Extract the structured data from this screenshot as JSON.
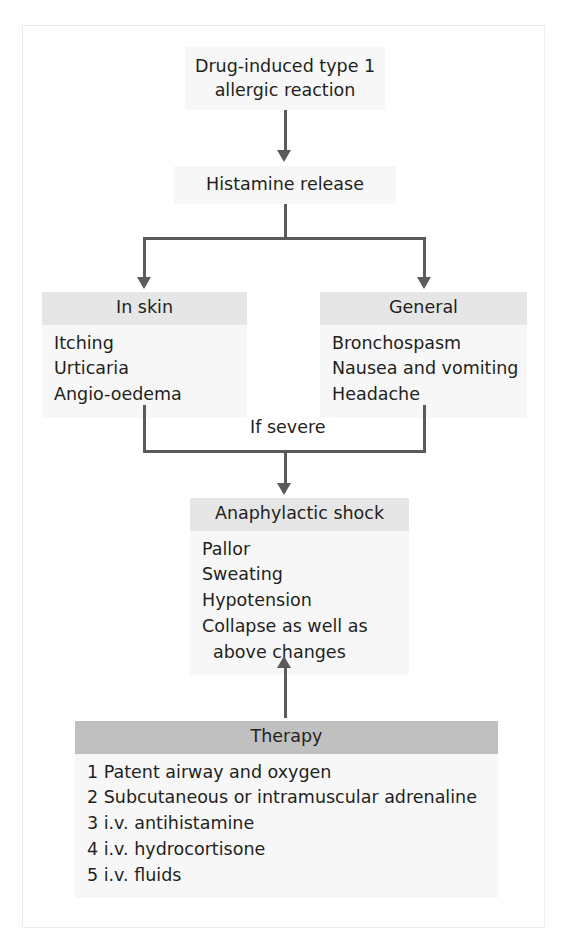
{
  "diagram": {
    "colors": {
      "header_band": "#e6e6e6",
      "therapy_header_band": "#c0c0c0",
      "box_fill": "#f7f7f7",
      "connector": "#5a5a5a",
      "text": "#231f20",
      "frame": "#ececec"
    },
    "nodes": {
      "cause": {
        "line1": "Drug-induced type 1",
        "line2": "allergic reaction"
      },
      "mediator": {
        "label": "Histamine release"
      },
      "skin": {
        "header": "In skin",
        "items": [
          "Itching",
          "Urticaria",
          "Angio-oedema"
        ]
      },
      "general": {
        "header": "General",
        "items": [
          "Bronchospasm",
          "Nausea and vomiting",
          "Headache"
        ]
      },
      "shock": {
        "header": "Anaphylactic shock",
        "items": [
          "Pallor",
          "Sweating",
          "Hypotension",
          "Collapse as well as",
          "above changes"
        ]
      },
      "therapy": {
        "header": "Therapy",
        "items": [
          "1 Patent airway and oxygen",
          "2 Subcutaneous or intramuscular adrenaline",
          "3 i.v. antihistamine",
          "4 i.v. hydrocortisone",
          "5 i.v. fluids"
        ]
      }
    },
    "edges": {
      "severity_label": "If severe"
    }
  }
}
